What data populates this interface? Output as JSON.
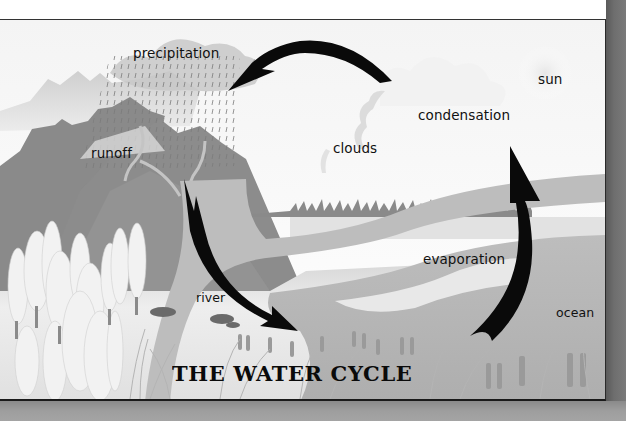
{
  "diagram": {
    "title": "THE WATER CYCLE",
    "labels": {
      "precipitation": "precipitation",
      "sun": "sun",
      "condensation": "condensation",
      "clouds": "clouds",
      "runoff": "runoff",
      "evaporation": "evaporation",
      "river": "river",
      "ocean": "ocean"
    },
    "arrows": [
      {
        "from": "condensation",
        "to": "precipitation"
      },
      {
        "from": "runoff",
        "to": "river"
      },
      {
        "from": "ocean",
        "to": "condensation",
        "via": "evaporation"
      }
    ],
    "colors": {
      "arrow": "#0a0a0a",
      "sky": "#fbfbfb",
      "mountain_dark": "#858585",
      "mountain_mid": "#9a9a9a",
      "water": "#b8b8b8",
      "ground": "#e4e4e4",
      "page_edge": "#6e6e6e"
    }
  }
}
